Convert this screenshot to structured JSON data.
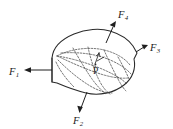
{
  "figure": {
    "type": "free-body-diagram",
    "caption": "",
    "background_color": "#ffffff",
    "line_color": "#2b2b2b",
    "dash_color": "#4a4a4a"
  },
  "body": {
    "name": "rigid-body",
    "shape": "irregular-blob",
    "fill_color": "#ffffff",
    "stroke_color": "#2b2b2b"
  },
  "interior_point": {
    "label": "P",
    "has_normal_vector": true,
    "x": 96,
    "y": 66
  },
  "forces": [
    {
      "id": "F1",
      "label": "F",
      "subscript": "1",
      "direction": "left",
      "label_x": 10,
      "label_y": 75,
      "tail_x": 52,
      "tail_y": 70,
      "tip_x": 25,
      "tip_y": 70
    },
    {
      "id": "F2",
      "label": "F",
      "subscript": "2",
      "direction": "down",
      "label_x": 74,
      "label_y": 124,
      "tail_x": 86,
      "tail_y": 92,
      "tip_x": 80,
      "tip_y": 113
    },
    {
      "id": "F3",
      "label": "F",
      "subscript": "3",
      "direction": "right",
      "label_x": 150,
      "label_y": 53,
      "tail_x": 137,
      "tail_y": 53,
      "tip_x": 148,
      "tip_y": 46
    },
    {
      "id": "F4",
      "label": "F",
      "subscript": "4",
      "direction": "up-right",
      "label_x": 120,
      "label_y": 18,
      "tail_x": 107,
      "tail_y": 43,
      "tip_x": 117,
      "tip_y": 22
    }
  ],
  "cut_section": {
    "description": "internal dashed cutting surface through body",
    "style": "dashed"
  }
}
